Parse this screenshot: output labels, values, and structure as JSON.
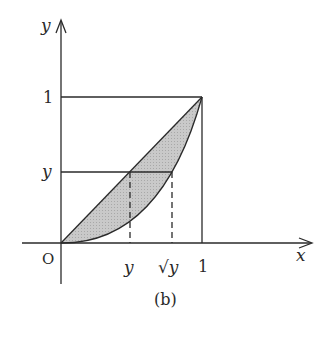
{
  "figure": {
    "caption": "(b)",
    "axes": {
      "x_label": "x",
      "y_label": "y",
      "origin_label": "O"
    },
    "ticks": {
      "x": [
        {
          "label": "y",
          "value": "y"
        },
        {
          "label": "√y",
          "value": "sqrt(y)"
        },
        {
          "label": "1",
          "value": 1
        }
      ],
      "y": [
        {
          "label": "1",
          "value": 1
        },
        {
          "label": "y",
          "value": "y"
        }
      ]
    },
    "curves": [
      {
        "name": "line",
        "equation": "y = x",
        "from": [
          0,
          0
        ],
        "to": [
          1,
          1
        ]
      },
      {
        "name": "parabola",
        "equation": "y = x^2",
        "from": [
          0,
          0
        ],
        "to": [
          1,
          1
        ]
      }
    ],
    "shaded_region": "between y = x and y = x^2 for 0 ≤ x ≤ 1",
    "guides": {
      "horizontal_at_y": "y, from x=0 to x=√y",
      "dashed_verticals": [
        "x = y",
        "x = √y"
      ],
      "unit_square": "lines x=1 and y=1"
    },
    "colors": {
      "stroke": "#2a2a2a",
      "fill": "#c4c4c4",
      "background": "#ffffff"
    }
  }
}
